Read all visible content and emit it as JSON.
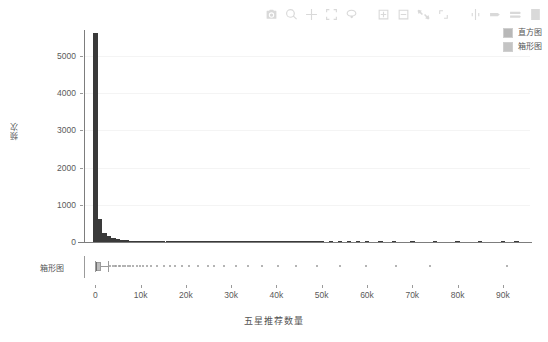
{
  "modebar": {
    "buttons": [
      {
        "name": "camera-icon",
        "title": "Download plot as a png"
      },
      {
        "name": "zoom-icon",
        "title": "Zoom"
      },
      {
        "name": "pan-icon",
        "title": "Pan"
      },
      {
        "name": "zoom-box-select-icon",
        "title": "Box Select"
      },
      {
        "name": "lasso-select-icon",
        "title": "Lasso Select"
      },
      {
        "name": "zoom-in-icon",
        "title": "Zoom in"
      },
      {
        "name": "zoom-out-icon",
        "title": "Zoom out"
      },
      {
        "name": "autoscale-icon",
        "title": "Autoscale"
      },
      {
        "name": "reset-axes-icon",
        "title": "Reset axes"
      },
      {
        "name": "spike-lines-icon",
        "title": "Toggle Spike Lines"
      },
      {
        "name": "hover-compare-icon",
        "title": "Show closest data on hover"
      },
      {
        "name": "hover-x-unified-icon",
        "title": "Compare data on hover"
      },
      {
        "name": "plotly-logo-icon",
        "title": "Produced with Plotly"
      }
    ]
  },
  "chart_data": {
    "type": "bar",
    "title": "",
    "xlabel": "五星推荐数量",
    "ylabel": "频次",
    "grid": true,
    "legend_position": "top-right",
    "xlim": [
      -2500,
      96000
    ],
    "ylim": [
      0,
      5700
    ],
    "xticks": [
      0,
      10000,
      20000,
      30000,
      40000,
      50000,
      60000,
      70000,
      80000,
      90000
    ],
    "xticklabels": [
      "0",
      "10k",
      "20k",
      "30k",
      "40k",
      "50k",
      "60k",
      "70k",
      "80k",
      "90k"
    ],
    "yticks": [
      0,
      1000,
      2000,
      3000,
      4000,
      5000
    ],
    "yticklabels": [
      "0",
      "1000",
      "2000",
      "3000",
      "4000",
      "5000"
    ],
    "legend": [
      {
        "label": "直方图",
        "color": "#b8b8b8"
      },
      {
        "label": "箱形图",
        "color": "#c4c4c4"
      }
    ],
    "series": [
      {
        "name": "直方图",
        "type": "histogram",
        "color": "#3a3a3a",
        "bin_width": 1000,
        "x": [
          0,
          1000,
          2000,
          3000,
          4000,
          5000,
          6000,
          7000,
          8000,
          9000,
          10000,
          11000,
          12000,
          13000,
          14000,
          15000,
          16000,
          17000,
          18000,
          19000,
          20000,
          21000,
          22000,
          23000,
          24000,
          25000,
          26000,
          27000,
          28000,
          29000,
          30000,
          31000,
          32000,
          33000,
          34000,
          35000,
          36000,
          37000,
          38000,
          39000,
          40000,
          41000,
          42000,
          43000,
          44000,
          45000,
          46000,
          47000,
          48000,
          49000,
          50000,
          52000,
          54000,
          56000,
          58000,
          60000,
          63000,
          66000,
          70000,
          75000,
          80000,
          85000,
          90000,
          93000
        ],
        "values": [
          5620,
          620,
          250,
          150,
          96,
          70,
          54,
          42,
          35,
          30,
          26,
          22,
          20,
          18,
          16,
          15,
          13,
          12,
          11,
          10,
          9,
          9,
          8,
          8,
          7,
          7,
          6,
          6,
          5,
          5,
          5,
          4,
          4,
          4,
          4,
          3,
          3,
          3,
          3,
          3,
          2,
          2,
          2,
          2,
          2,
          2,
          2,
          2,
          2,
          2,
          2,
          1,
          1,
          1,
          1,
          1,
          1,
          1,
          1,
          1,
          1,
          1,
          1,
          1
        ]
      },
      {
        "name": "箱形图",
        "type": "box",
        "color": "#bdbdbd",
        "min": 0,
        "q1": 80,
        "median": 260,
        "q3": 1150,
        "whisker_low": 0,
        "whisker_high": 2700,
        "max": 93000,
        "outliers": [
          3100,
          3600,
          4050,
          4400,
          4900,
          5300,
          5800,
          6300,
          6900,
          7400,
          8100,
          8900,
          9600,
          10400,
          11200,
          12100,
          13300,
          14900,
          16200,
          17400,
          18900,
          20500,
          22400,
          24600,
          26100,
          28300,
          30900,
          33400,
          36700,
          40200,
          44100,
          48800,
          53900,
          59600,
          66200,
          73800,
          90800
        ]
      }
    ],
    "box_row_label": "箱形图"
  }
}
